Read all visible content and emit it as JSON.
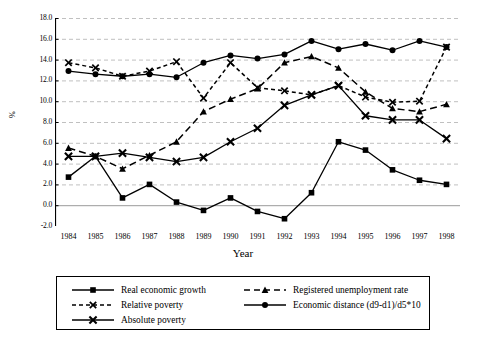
{
  "chart_data": {
    "type": "line",
    "title": "",
    "xlabel": "Year",
    "ylabel": "%",
    "grid": true,
    "legend_position": "bottom",
    "x": [
      1984,
      1985,
      1986,
      1987,
      1988,
      1989,
      1990,
      1991,
      1992,
      1993,
      1994,
      1995,
      1996,
      1997,
      1998
    ],
    "categories": [
      "1984",
      "1985",
      "1986",
      "1987",
      "1988",
      "1989",
      "1990",
      "1991",
      "1992",
      "1993",
      "1994",
      "1995",
      "1996",
      "1997",
      "1998"
    ],
    "ylim": [
      -2.0,
      18.0
    ],
    "ytick_step": 2.0,
    "ytick_labels": [
      "18.0",
      "16.0",
      "14.0",
      "12.0",
      "10.0",
      "8.0",
      "6.0",
      "4.0",
      "2.0",
      "0.0",
      "-2.0"
    ],
    "ytick_values": [
      18.0,
      16.0,
      14.0,
      12.0,
      10.0,
      8.0,
      6.0,
      4.0,
      2.0,
      0.0,
      -2.0
    ],
    "series": [
      {
        "name": "Real economic growth",
        "marker": "square",
        "line": "solid",
        "color": "#000000",
        "values": [
          2.7,
          4.7,
          0.7,
          2.0,
          0.3,
          -0.5,
          0.7,
          -0.6,
          -1.3,
          1.2,
          6.1,
          5.3,
          3.4,
          2.4,
          2.0
        ]
      },
      {
        "name": "Registered unemployment rate",
        "marker": "triangle",
        "line": "dashed",
        "color": "#000000",
        "values": [
          5.5,
          4.7,
          3.5,
          4.8,
          6.1,
          9.0,
          10.2,
          11.2,
          13.7,
          14.3,
          13.2,
          10.9,
          9.3,
          9.0,
          9.7
        ]
      },
      {
        "name": "Relative poverty",
        "marker": "x",
        "line": "dashed",
        "color": "#000000",
        "values": [
          13.7,
          13.2,
          12.4,
          12.9,
          13.8,
          10.3,
          13.7,
          11.3,
          11.0,
          10.6,
          11.5,
          10.4,
          9.9,
          10.0,
          15.2
        ]
      },
      {
        "name": "Economic distance (d9-d1)/d5*10",
        "marker": "circle",
        "line": "solid",
        "color": "#000000",
        "values": [
          12.9,
          12.6,
          12.4,
          12.6,
          12.3,
          13.7,
          14.4,
          14.1,
          14.5,
          15.8,
          15.0,
          15.5,
          14.9,
          15.8,
          15.2
        ]
      },
      {
        "name": "Absolute poverty",
        "marker": "x-bold",
        "line": "solid",
        "color": "#000000",
        "values": [
          4.7,
          4.7,
          5.0,
          4.6,
          4.2,
          4.6,
          6.1,
          7.4,
          9.6,
          10.6,
          11.5,
          8.6,
          8.2,
          8.2,
          6.4
        ]
      }
    ]
  },
  "legend": {
    "entries": [
      {
        "label": "Real economic growth",
        "marker": "square",
        "line": "solid"
      },
      {
        "label": "Registered unemployment rate",
        "marker": "triangle",
        "line": "dashed"
      },
      {
        "label": "Relative poverty",
        "marker": "x",
        "line": "dashed"
      },
      {
        "label": "Economic distance (d9-d1)/d5*10",
        "marker": "circle",
        "line": "solid"
      },
      {
        "label": "Absolute poverty",
        "marker": "x-bold",
        "line": "solid"
      }
    ]
  }
}
